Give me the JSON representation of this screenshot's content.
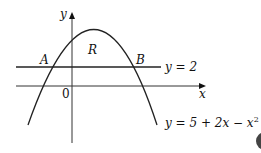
{
  "diagram": {
    "axes": {
      "x_label": "x",
      "y_label": "y",
      "origin_label": "0"
    },
    "curve": {
      "equation_prefix": "y = 5 + 2x − x",
      "equation_exponent": "2"
    },
    "line": {
      "equation": "y = 2"
    },
    "points": {
      "A": "A",
      "B": "B"
    },
    "region": {
      "label": "R"
    },
    "colors": {
      "ink": "#111111",
      "background": "#ffffff"
    }
  }
}
